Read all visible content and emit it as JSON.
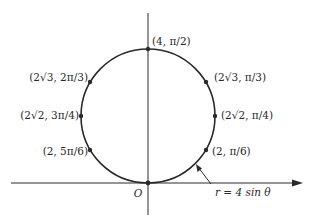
{
  "diagram": {
    "type": "polar-curve",
    "equation_label": "r = 4 sin θ",
    "origin_label": "O",
    "colors": {
      "stroke": "#2a2a2a",
      "background": "#ffffff"
    },
    "geometry": {
      "center_x": 148,
      "center_y": 116,
      "radius": 67,
      "axis_x_start": 11,
      "axis_x_end": 303,
      "axis_y_top": 13,
      "axis_y_bottom": 215
    },
    "points": [
      {
        "id": "p-pi-2",
        "label": "(4, π/2)",
        "r": "4",
        "theta": "π/2",
        "x": 148,
        "y": 49,
        "lx": 152,
        "ly": 45,
        "anchor": "start"
      },
      {
        "id": "p-pi-3",
        "label": "(2√3, π/3)",
        "r": "2√3",
        "theta": "π/3",
        "x": 206,
        "y": 82,
        "lx": 214,
        "ly": 81,
        "anchor": "start"
      },
      {
        "id": "p-2pi-3",
        "label": "(2√3, 2π/3)",
        "r": "2√3",
        "theta": "2π/3",
        "x": 90,
        "y": 82,
        "lx": 88,
        "ly": 81,
        "anchor": "end"
      },
      {
        "id": "p-pi-4",
        "label": "(2√2, π/4)",
        "r": "2√2",
        "theta": "π/4",
        "x": 215,
        "y": 116,
        "lx": 221,
        "ly": 119,
        "anchor": "start"
      },
      {
        "id": "p-3pi-4",
        "label": "(2√2, 3π/4)",
        "r": "2√2",
        "theta": "3π/4",
        "x": 81,
        "y": 116,
        "lx": 79,
        "ly": 119,
        "anchor": "end"
      },
      {
        "id": "p-pi-6",
        "label": "(2, π/6)",
        "r": "2",
        "theta": "π/6",
        "x": 206,
        "y": 150,
        "lx": 212,
        "ly": 155,
        "anchor": "start"
      },
      {
        "id": "p-5pi-6",
        "label": "(2, 5π/6)",
        "r": "2",
        "theta": "5π/6",
        "x": 90,
        "y": 150,
        "lx": 88,
        "ly": 155,
        "anchor": "end"
      },
      {
        "id": "p-origin",
        "label": "",
        "r": "0",
        "theta": "0",
        "x": 148,
        "y": 183
      }
    ]
  }
}
